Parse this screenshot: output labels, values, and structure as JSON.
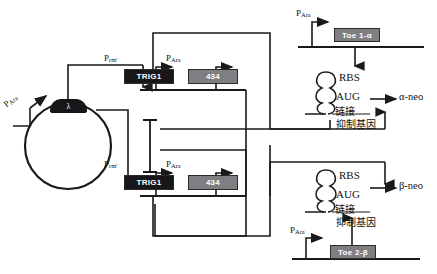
{
  "figure": {
    "background_color": "#ffffff",
    "line_color": "#1a1a1a",
    "gene_black_color": "#17171a",
    "gene_gray_color": "#7e7e83"
  },
  "plasmid": {
    "name": "plasmid-circle",
    "promoter_label": "P",
    "promoter_sub": "Ara",
    "cap_label": "λ"
  },
  "cassettes": [
    {
      "id": "cassette-top",
      "promoter1_label": "P",
      "promoter1_sub": "rm'",
      "gene1_label": "TRIG1",
      "gene1_style": "black",
      "promoter2_label": "P",
      "promoter2_sub": "Ara",
      "gene2_label": "434",
      "gene2_style": "gray"
    },
    {
      "id": "cassette-bottom",
      "promoter1_label": "P",
      "promoter1_sub": "rm'",
      "gene1_label": "TRIG1",
      "gene1_style": "black",
      "promoter2_label": "P",
      "promoter2_sub": "Ara",
      "gene2_label": "434",
      "gene2_style": "gray"
    }
  ],
  "toehold_modules": [
    {
      "id": "toehold-alpha",
      "promoter_label": "P",
      "promoter_sub": "Ara",
      "gene_label": "Toe 1-α",
      "gene_style": "gray",
      "hairpin": {
        "rbs_label": "RBS",
        "start_codon_label": "AUG",
        "linker_label": "链接",
        "gene_label": "抑制基因"
      },
      "output_label": "α-neo"
    },
    {
      "id": "toehold-beta",
      "promoter_label": "P",
      "promoter_sub": "Ara",
      "gene_label": "Toe 2-β",
      "gene_style": "gray",
      "hairpin": {
        "rbs_label": "RBS",
        "start_codon_label": "AUG",
        "linker_label": "链接",
        "gene_label": "抑制基因"
      },
      "output_label": "β-neo"
    }
  ]
}
